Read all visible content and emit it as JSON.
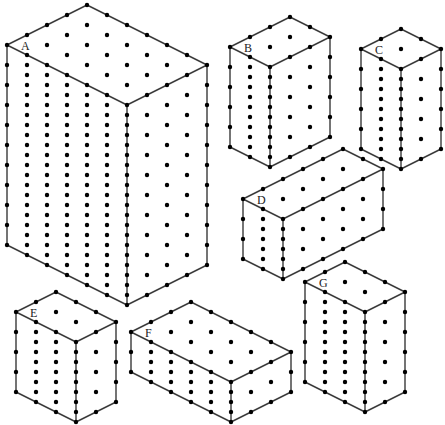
{
  "diagram": {
    "width": 445,
    "height": 425,
    "grid_step": {
      "dx": 20,
      "dy": 10,
      "vertical": 20
    },
    "colors": {
      "edge": "#3a3a3a",
      "dot": "#000000",
      "background": "#ffffff",
      "label": "#222222"
    },
    "boxes": [
      {
        "label": "A",
        "top": [
          87,
          5
        ],
        "left_steps": 4,
        "right_steps": 6,
        "height_steps": 10
      },
      {
        "label": "B",
        "top": [
          290,
          17
        ],
        "left_steps": 3,
        "right_steps": 2,
        "height_steps": 5
      },
      {
        "label": "C",
        "top": [
          401,
          29
        ],
        "left_steps": 2,
        "right_steps": 2,
        "height_steps": 5
      },
      {
        "label": "D",
        "top": [
          343,
          149
        ],
        "left_steps": 5,
        "right_steps": 2,
        "height_steps": 3
      },
      {
        "label": "E",
        "top": [
          56,
          292
        ],
        "left_steps": 2,
        "right_steps": 3,
        "height_steps": 4
      },
      {
        "label": "F",
        "top": [
          191,
          302
        ],
        "left_steps": 3,
        "right_steps": 5,
        "height_steps": 2
      },
      {
        "label": "G",
        "top": [
          345,
          262
        ],
        "left_steps": 2,
        "right_steps": 3,
        "height_steps": 5
      }
    ]
  }
}
